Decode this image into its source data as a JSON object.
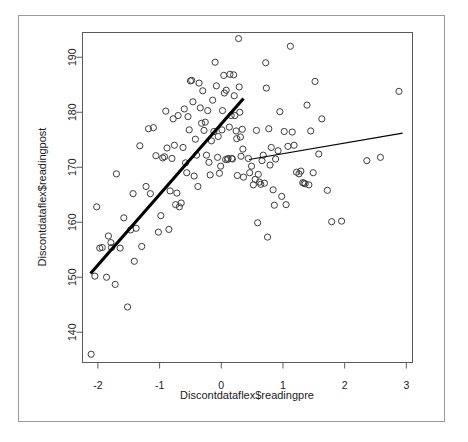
{
  "window": {
    "frame_label": "plot-window-frame",
    "background": "#ffffff"
  },
  "chart_data": {
    "type": "scatter",
    "title": "",
    "subtitle": "",
    "xlabel": "Discontdataflex$readingpre",
    "ylabel": "Discontdataflex$readingpost",
    "xlim": [
      -2.25,
      3.1
    ],
    "ylim": [
      134.5,
      194.5
    ],
    "xticks": [
      -2,
      -1,
      0,
      1,
      2,
      3
    ],
    "xtick_labels": [
      "-2",
      "-1",
      "0",
      "1",
      "2",
      "3"
    ],
    "yticks": [
      140,
      150,
      160,
      170,
      180,
      190
    ],
    "ytick_labels": [
      "140",
      "150",
      "160",
      "170",
      "180",
      "190"
    ],
    "grid": false,
    "legend": "none",
    "point_style": {
      "marker": "open-circle",
      "radius": 3.1,
      "stroke": "#3d3d3d",
      "fill": "none"
    },
    "cutoff": 0.4,
    "series": [
      {
        "name": "observations",
        "x": [
          -2.11,
          -2.05,
          -2.02,
          -1.97,
          -1.93,
          -1.86,
          -1.83,
          -1.79,
          -1.78,
          -1.72,
          -1.7,
          -1.64,
          -1.58,
          -1.52,
          -1.47,
          -1.43,
          -1.41,
          -1.38,
          -1.32,
          -1.29,
          -1.22,
          -1.18,
          -1.15,
          -1.1,
          -1.06,
          -1.02,
          -0.98,
          -0.95,
          -0.92,
          -0.9,
          -0.88,
          -0.85,
          -0.83,
          -0.8,
          -0.78,
          -0.76,
          -0.74,
          -0.72,
          -0.7,
          -0.68,
          -0.65,
          -0.62,
          -0.6,
          -0.58,
          -0.56,
          -0.54,
          -0.52,
          -0.5,
          -0.48,
          -0.46,
          -0.44,
          -0.42,
          -0.4,
          -0.38,
          -0.36,
          -0.34,
          -0.32,
          -0.3,
          -0.28,
          -0.26,
          -0.24,
          -0.22,
          -0.2,
          -0.18,
          -0.16,
          -0.14,
          -0.12,
          -0.1,
          -0.08,
          -0.06,
          -0.05,
          -0.03,
          -0.01,
          0.01,
          0.02,
          0.04,
          0.05,
          0.07,
          0.08,
          0.1,
          0.11,
          0.13,
          0.14,
          0.16,
          0.17,
          0.18,
          0.2,
          0.21,
          0.22,
          0.24,
          0.25,
          0.26,
          0.28,
          0.29,
          0.3,
          0.31,
          0.32,
          0.34,
          0.35,
          0.36,
          0.44,
          0.46,
          0.49,
          0.52,
          0.55,
          0.57,
          0.59,
          0.6,
          0.62,
          0.64,
          0.66,
          0.68,
          0.7,
          0.72,
          0.73,
          0.75,
          0.77,
          0.79,
          0.81,
          0.84,
          0.86,
          0.88,
          0.92,
          0.95,
          0.98,
          1.02,
          1.05,
          1.08,
          1.12,
          1.15,
          1.18,
          1.22,
          1.26,
          1.29,
          1.32,
          1.34,
          1.36,
          1.39,
          1.42,
          1.45,
          1.49,
          1.52,
          1.58,
          1.63,
          1.72,
          1.79,
          1.95,
          2.36,
          2.58,
          2.88
        ],
        "y": [
          136.0,
          150.2,
          162.8,
          155.3,
          155.4,
          150.0,
          157.5,
          156.3,
          155.4,
          148.7,
          168.8,
          155.3,
          160.8,
          144.6,
          158.6,
          165.2,
          152.9,
          158.9,
          173.9,
          155.6,
          166.5,
          177.0,
          165.2,
          177.2,
          172.1,
          158.2,
          161.2,
          171.7,
          171.9,
          180.2,
          173.5,
          158.7,
          165.7,
          171.6,
          178.8,
          174.0,
          163.2,
          165.3,
          179.4,
          162.8,
          163.5,
          173.6,
          180.6,
          170.8,
          169.0,
          179.2,
          176.8,
          185.7,
          185.8,
          181.9,
          168.4,
          175.1,
          172.2,
          166.5,
          185.3,
          180.8,
          178.0,
          183.9,
          176.7,
          178.2,
          172.2,
          180.3,
          170.9,
          168.6,
          174.8,
          182.2,
          176.5,
          189.1,
          184.8,
          171.8,
          175.6,
          168.9,
          170.2,
          176.8,
          180.3,
          186.7,
          183.5,
          171.4,
          184.0,
          171.4,
          171.6,
          177.3,
          186.9,
          179.4,
          171.6,
          171.5,
          186.8,
          183.0,
          179.4,
          176.6,
          175.2,
          168.5,
          193.4,
          184.6,
          180.0,
          175.5,
          172.0,
          176.9,
          173.3,
          168.2,
          171.6,
          169.0,
          170.2,
          166.8,
          167.8,
          176.7,
          159.9,
          168.7,
          167.3,
          166.9,
          171.2,
          172.2,
          167.1,
          189.0,
          184.4,
          157.3,
          177.0,
          170.4,
          173.6,
          165.9,
          163.1,
          171.5,
          173.0,
          180.1,
          164.7,
          176.5,
          163.2,
          173.8,
          192.0,
          176.4,
          174.0,
          169.1,
          168.8,
          169.3,
          167.2,
          167.1,
          167.0,
          181.3,
          166.8,
          176.6,
          169.0,
          185.6,
          172.4,
          178.8,
          165.8,
          160.1,
          160.2,
          171.2,
          171.8,
          183.8
        ]
      }
    ],
    "fit_lines": [
      {
        "name": "left-segment-fit",
        "side": "left",
        "x_start": -2.12,
        "y_start": 150.7,
        "x_end": 0.36,
        "y_end": 182.5,
        "stroke": "#000000",
        "width": 3.1
      },
      {
        "name": "right-segment-fit",
        "side": "right",
        "x_start": 0.45,
        "y_start": 171.4,
        "x_end": 2.94,
        "y_end": 176.2,
        "stroke": "#000000",
        "width": 1.1
      }
    ]
  }
}
